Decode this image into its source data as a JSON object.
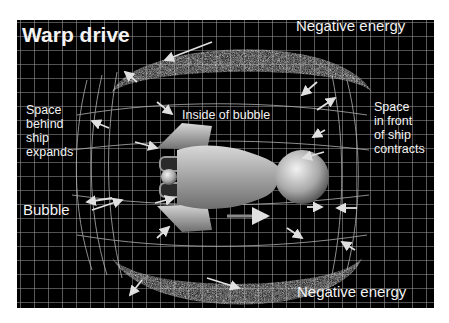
{
  "title": "Warp drive",
  "labels": {
    "negative_energy_top": "Negative energy",
    "negative_energy_bottom": "Negative energy",
    "inside_bubble": "Inside of bubble",
    "space_behind": [
      "Space",
      "behind",
      "ship",
      "expands"
    ],
    "space_front": [
      "Space",
      "in front",
      "of ship",
      "contracts"
    ],
    "bubble": "Bubble"
  },
  "colors": {
    "background": "#000000",
    "grid": "#bdbdbd",
    "text": "#f2f2f2",
    "arrows": "#e0e0e0"
  }
}
